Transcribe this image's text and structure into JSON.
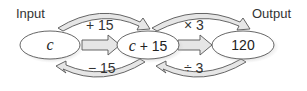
{
  "labels": {
    "input": "Input",
    "output": "Output"
  },
  "nodes": [
    {
      "id": "start",
      "text": "c"
    },
    {
      "id": "middle",
      "text_var": "c",
      "text_rest": " + 15"
    },
    {
      "id": "end",
      "text": "120"
    }
  ],
  "forward_ops": [
    "+ 15",
    "× 3"
  ],
  "inverse_ops": [
    "− 15",
    "÷ 3"
  ],
  "colors": {
    "stroke": "#555555",
    "fill": "#e6e6e6",
    "node_fill": "#ffffff"
  }
}
